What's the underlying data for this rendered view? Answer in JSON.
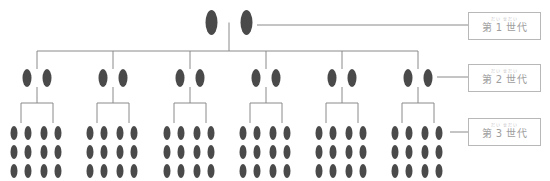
{
  "colors": {
    "person": "#4a4a4a",
    "line": "#8a8a8a",
    "label_border": "#b8b8b8",
    "label_text": "#9e9e9e"
  },
  "generations": [
    {
      "id": 1,
      "label": "第 1 世代",
      "ruby": "だい    せだい",
      "box_top": 12,
      "pairs": 1
    },
    {
      "id": 2,
      "label": "第 2 世代",
      "ruby": "だい    せだい",
      "box_top": 64,
      "pairs": 6
    },
    {
      "id": 3,
      "label": "第 3 世代",
      "ruby": "だい    せだい",
      "box_top": 118,
      "groups": 6,
      "individuals_per_group": 12
    }
  ],
  "layout": {
    "gen1": {
      "cx": 229,
      "y": 10,
      "h": 25,
      "w": 12,
      "gap": 35
    },
    "gen2": {
      "centers": [
        37,
        113,
        190,
        266,
        342,
        418
      ],
      "y": 69,
      "h": 18,
      "w": 9,
      "gap": 20,
      "bus_y": 51
    },
    "gen3": {
      "bracket_y": 103,
      "bracket_half": 16,
      "rows": [
        133,
        152,
        171
      ],
      "col_offsets": [
        -23,
        -9,
        7,
        21
      ],
      "h": 14,
      "w": 7
    },
    "connectors": [
      {
        "x1": 257,
        "x2": 468,
        "y": 25
      },
      {
        "x1": 437,
        "x2": 468,
        "y": 77
      },
      {
        "x1": 450,
        "x2": 468,
        "y": 132
      }
    ]
  }
}
